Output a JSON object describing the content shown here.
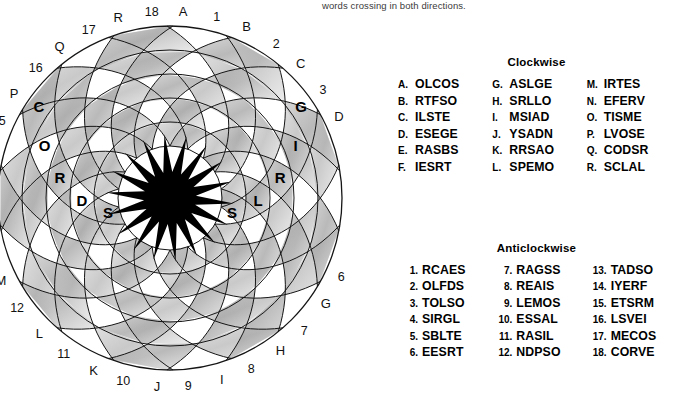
{
  "header": {
    "note": "words crossing in both directions."
  },
  "puzzle": {
    "name": "circular-spiral-word-grid",
    "rings": 5,
    "arms": 18,
    "center_color": "#000000",
    "grid_line_color": "#1a1a1a",
    "shade_color": "#b4b4b4",
    "blank_color": "#ffffff",
    "outer_letter_labels": [
      "A",
      "B",
      "C",
      "D",
      "E",
      "F",
      "G",
      "H",
      "I",
      "J",
      "K",
      "L",
      "M",
      "N",
      "O",
      "P",
      "Q",
      "R"
    ],
    "outer_number_labels": [
      "1",
      "2",
      "3",
      "4",
      "5",
      "6",
      "7",
      "8",
      "9",
      "10",
      "11",
      "12",
      "13",
      "14",
      "15",
      "16",
      "17",
      "18"
    ],
    "filled_clockwise_word": "CORDS",
    "filled_clockwise_letters": [
      "C",
      "O",
      "R",
      "D",
      "S"
    ],
    "filled_anticlockwise_word": "SLRIG",
    "filled_anticlockwise_letters": [
      "S",
      "L",
      "R",
      "I",
      "G"
    ]
  },
  "clockwise": {
    "title": "Clockwise",
    "entries": [
      {
        "key": "A.",
        "word": "OLCOS"
      },
      {
        "key": "B.",
        "word": "RTFSO"
      },
      {
        "key": "C.",
        "word": "ILSTE"
      },
      {
        "key": "D.",
        "word": "ESEGE"
      },
      {
        "key": "E.",
        "word": "RASBS"
      },
      {
        "key": "F.",
        "word": "IESRT"
      },
      {
        "key": "G.",
        "word": "ASLGE"
      },
      {
        "key": "H.",
        "word": "SRLLO"
      },
      {
        "key": "I.",
        "word": "MSIAD"
      },
      {
        "key": "J.",
        "word": "YSADN"
      },
      {
        "key": "K.",
        "word": "RRSAO"
      },
      {
        "key": "L.",
        "word": "SPEMO"
      },
      {
        "key": "M.",
        "word": "IRTES"
      },
      {
        "key": "N.",
        "word": "EFERV"
      },
      {
        "key": "O.",
        "word": "TISME"
      },
      {
        "key": "P.",
        "word": "LVOSE"
      },
      {
        "key": "Q.",
        "word": "CODSR"
      },
      {
        "key": "R.",
        "word": "SCLAL"
      }
    ]
  },
  "anticlockwise": {
    "title": "Anticlockwise",
    "entries": [
      {
        "key": "1.",
        "word": "RCAES"
      },
      {
        "key": "2.",
        "word": "OLFDS"
      },
      {
        "key": "3.",
        "word": "TOLSO"
      },
      {
        "key": "4.",
        "word": "SIRGL"
      },
      {
        "key": "5.",
        "word": "SBLTE"
      },
      {
        "key": "6.",
        "word": "EESRT"
      },
      {
        "key": "7.",
        "word": "RAGSS"
      },
      {
        "key": "8.",
        "word": "REAIS"
      },
      {
        "key": "9.",
        "word": "LEMOS"
      },
      {
        "key": "10.",
        "word": "ESSAL"
      },
      {
        "key": "11.",
        "word": "RASIL"
      },
      {
        "key": "12.",
        "word": "NDPSO"
      },
      {
        "key": "13.",
        "word": "TADSO"
      },
      {
        "key": "14.",
        "word": "IYERF"
      },
      {
        "key": "15.",
        "word": "ETSRM"
      },
      {
        "key": "16.",
        "word": "LSVEI"
      },
      {
        "key": "17.",
        "word": "MECOS"
      },
      {
        "key": "18.",
        "word": "CORVE"
      }
    ]
  }
}
